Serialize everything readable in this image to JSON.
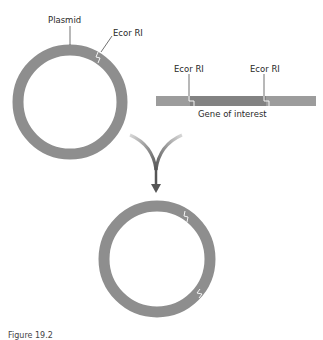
{
  "labels": {
    "plasmid": "Plasmid",
    "ecor_plasmid": "Ecor RI",
    "ecor_left": "Ecor RI",
    "ecor_right": "Ecor RI",
    "gene": "Gene of interest"
  },
  "caption": "Figure 19.2",
  "colors": {
    "ring": "#8e8e8e",
    "bar_end": "#9c9c9c",
    "bar_mid": "#828282",
    "arrow": "#5a5a5a"
  }
}
